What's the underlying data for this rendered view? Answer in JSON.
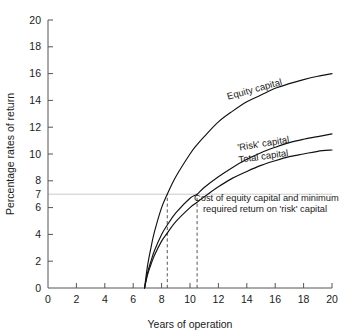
{
  "chart_data": {
    "type": "line",
    "title": "",
    "xlabel": "Years of operation",
    "ylabel": "Percentage rates of return",
    "xlim": [
      0,
      20
    ],
    "ylim": [
      0,
      20
    ],
    "grid": false,
    "legend_position": "inline-curve-labels",
    "xticks": [
      0,
      2,
      4,
      6,
      8,
      10,
      12,
      14,
      16,
      18,
      20
    ],
    "xticklabels": [
      "0",
      "2",
      "4",
      "6",
      "8",
      "10",
      "12",
      "14",
      "16",
      "18",
      "20"
    ],
    "yticks": [
      0,
      2,
      4,
      6,
      8,
      10,
      12,
      14,
      16,
      18,
      20
    ],
    "yticklabels": [
      "0",
      "2",
      "4",
      "6",
      "8",
      "10",
      "12",
      "14",
      "16",
      "18",
      "20"
    ],
    "extra_ytick": {
      "value": 7,
      "label": "7",
      "gridline": true
    },
    "reference_lines": [
      {
        "orientation": "horizontal",
        "value": 7,
        "style": "solid-light",
        "note": "Cost of equity capital and minimum required return on 'risk' capital"
      },
      {
        "orientation": "vertical",
        "value": 8.4,
        "style": "dashed",
        "from": 0,
        "to": 7
      },
      {
        "orientation": "vertical",
        "value": 10.5,
        "style": "dashed",
        "from": 0,
        "to": 7
      }
    ],
    "x": [
      6.8,
      7.0,
      7.25,
      7.5,
      8.0,
      8.4,
      9.0,
      10.0,
      10.5,
      11.0,
      12.0,
      13.0,
      14.0,
      15.0,
      16.0,
      17.0,
      18.0,
      19.0,
      20.0
    ],
    "series": [
      {
        "name": "Equity capital",
        "label": "Equity capital",
        "values": [
          0.0,
          1.6,
          3.0,
          4.2,
          6.0,
          7.0,
          8.3,
          10.0,
          10.7,
          11.3,
          12.4,
          13.2,
          13.9,
          14.4,
          14.9,
          15.25,
          15.55,
          15.8,
          16.0
        ]
      },
      {
        "name": "'Risk' capital",
        "label": "'Risk' capital",
        "values": [
          0.0,
          1.1,
          2.0,
          2.8,
          4.0,
          4.7,
          5.6,
          6.7,
          7.0,
          7.5,
          8.3,
          9.0,
          9.6,
          10.1,
          10.5,
          10.85,
          11.1,
          11.3,
          11.5
        ]
      },
      {
        "name": "Total capital",
        "label": "Total capital",
        "values": [
          0.0,
          0.95,
          1.75,
          2.45,
          3.5,
          4.1,
          4.95,
          6.0,
          6.4,
          6.8,
          7.55,
          8.2,
          8.7,
          9.15,
          9.5,
          9.8,
          10.0,
          10.2,
          10.3
        ]
      }
    ],
    "annotations": [
      {
        "id": "cost-of-equity-note",
        "line1": "Cost of equity capital and minimum",
        "line2": "required return on 'risk' capital"
      }
    ],
    "colors": {
      "curve": "#111111",
      "axis": "#555555",
      "gridline": "#bbbbbb",
      "background": "#ffffff",
      "text": "#1a1a1a"
    }
  }
}
